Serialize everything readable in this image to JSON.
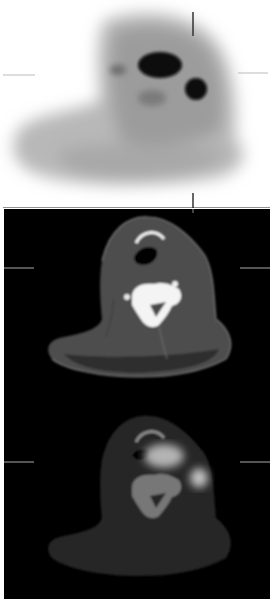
{
  "figure": {
    "caption_fragment": "PET/CT axial neck",
    "panels": [
      {
        "id": "pet",
        "label": "PET axial slice (inverted grayscale)",
        "background": "#ffffff"
      },
      {
        "id": "ct",
        "label": "CT axial slice, neck level",
        "background": "#000000"
      },
      {
        "id": "fused",
        "label": "Fused PET/CT axial slice",
        "background": "#000000"
      }
    ],
    "findings": [
      {
        "name": "lesion-large",
        "description": "Large hypermetabolic focus, anterior neck"
      },
      {
        "name": "lesion-small",
        "description": "Small round hypermetabolic focus, right lateral"
      }
    ]
  }
}
